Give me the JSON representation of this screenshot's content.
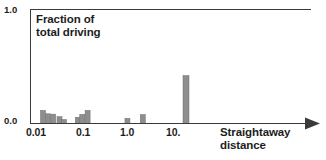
{
  "chart_data": {
    "type": "bar",
    "title": "Fraction of\ntotal driving",
    "title_line1": "Fraction of",
    "title_line2": "total driving",
    "xlabel": "Straightaway\ndistance",
    "xlabel_line1": "Straightaway",
    "xlabel_line2": "distance",
    "ylabel": "",
    "xscale": "log",
    "grid": false,
    "legend": null,
    "ylim": [
      0.0,
      1.0
    ],
    "y_tick_labels": [
      "0.0",
      "1.0"
    ],
    "y_ticks": [
      0.0,
      1.0
    ],
    "x_tick_labels": [
      "0.01",
      "0.1",
      "1.0",
      "10."
    ],
    "x_ticks": [
      0.01,
      0.1,
      1.0,
      10.0
    ],
    "xlim": [
      0.004,
      40.0
    ],
    "bar_color": "#8e8e8e",
    "axis_color": "#3b3b3b",
    "text_color": "#1d1d1d",
    "x": [
      0.0105,
      0.0135,
      0.0175,
      0.024,
      0.03,
      0.06,
      0.075,
      0.098,
      0.72,
      1.55,
      13.5
    ],
    "values": [
      0.115,
      0.085,
      0.082,
      0.06,
      0.035,
      0.055,
      0.08,
      0.115,
      0.045,
      0.078,
      0.42
    ],
    "bars": [
      {
        "x": 0.0105,
        "value": 0.115
      },
      {
        "x": 0.0135,
        "value": 0.085
      },
      {
        "x": 0.0175,
        "value": 0.082
      },
      {
        "x": 0.024,
        "value": 0.06
      },
      {
        "x": 0.03,
        "value": 0.035
      },
      {
        "x": 0.06,
        "value": 0.055
      },
      {
        "x": 0.075,
        "value": 0.08
      },
      {
        "x": 0.098,
        "value": 0.115
      },
      {
        "x": 0.72,
        "value": 0.045
      },
      {
        "x": 1.55,
        "value": 0.078
      },
      {
        "x": 13.5,
        "value": 0.42
      }
    ]
  }
}
